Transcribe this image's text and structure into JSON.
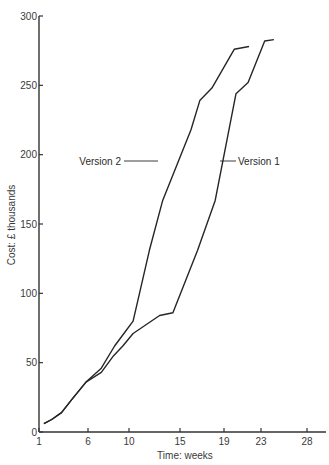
{
  "chart_data": {
    "type": "line",
    "title": "",
    "xlabel": "Time: weeks",
    "ylabel": "Cost: £ thousands",
    "xlim": [
      1,
      30
    ],
    "ylim": [
      0,
      300
    ],
    "x_ticks": [
      1,
      6,
      10,
      15,
      19,
      23,
      28
    ],
    "y_ticks": [
      0,
      50,
      100,
      150,
      200,
      250,
      300
    ],
    "grid": false,
    "legend": "inline labels",
    "series": [
      {
        "name": "Version 2",
        "label_anchor": {
          "x": 13.5,
          "y": 195
        },
        "points": [
          [
            1.5,
            6
          ],
          [
            2.3,
            9
          ],
          [
            3.3,
            14
          ],
          [
            4.3,
            23
          ],
          [
            5.8,
            36
          ],
          [
            7.3,
            46
          ],
          [
            8.6,
            62
          ],
          [
            9.5,
            71
          ],
          [
            10.4,
            80
          ],
          [
            12.0,
            131
          ],
          [
            13.3,
            167
          ],
          [
            16.0,
            218
          ],
          [
            16.8,
            239
          ],
          [
            17.9,
            248
          ],
          [
            20.1,
            276
          ],
          [
            21.7,
            278
          ]
        ]
      },
      {
        "name": "Version 1",
        "label_anchor": {
          "x": 18.0,
          "y": 195
        },
        "points": [
          [
            1.5,
            6
          ],
          [
            2.3,
            9
          ],
          [
            3.3,
            14
          ],
          [
            4.3,
            23
          ],
          [
            5.8,
            36
          ],
          [
            7.3,
            43
          ],
          [
            8.5,
            55
          ],
          [
            9.4,
            62
          ],
          [
            10.4,
            71
          ],
          [
            13.0,
            84
          ],
          [
            14.3,
            86
          ],
          [
            16.6,
            131
          ],
          [
            18.2,
            167
          ],
          [
            20.3,
            244
          ],
          [
            21.6,
            252
          ],
          [
            23.4,
            282
          ],
          [
            24.4,
            283
          ]
        ]
      }
    ]
  },
  "colors": {
    "line": "#262626",
    "axis": "#333333",
    "text": "#3a3a3a",
    "background": "#ffffff"
  }
}
